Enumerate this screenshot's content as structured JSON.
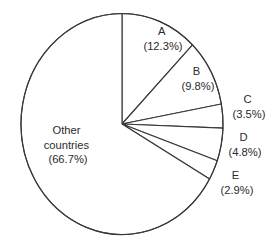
{
  "chart_data": {
    "type": "pie",
    "title": "",
    "subtitle": "",
    "xlabel": "",
    "ylabel": "",
    "legend_position": "none",
    "grid": false,
    "start_angle_deg": 0,
    "direction": "clockwise",
    "categories": [
      "A",
      "B",
      "C",
      "D",
      "E",
      "Other countries"
    ],
    "values": [
      12.3,
      9.8,
      3.5,
      4.8,
      2.9,
      66.7
    ],
    "units": "%",
    "slices": [
      {
        "name": "A",
        "label": "A",
        "value": 12.3,
        "percent_text": "(12.3%)",
        "label_position": "inside",
        "fill": "#ffffff",
        "stroke": "#3a3a3a"
      },
      {
        "name": "B",
        "label": "B",
        "value": 9.8,
        "percent_text": "(9.8%)",
        "label_position": "inside",
        "fill": "#ffffff",
        "stroke": "#3a3a3a"
      },
      {
        "name": "C",
        "label": "C",
        "value": 3.5,
        "percent_text": "(3.5%)",
        "label_position": "outside",
        "fill": "#ffffff",
        "stroke": "#3a3a3a"
      },
      {
        "name": "D",
        "label": "D",
        "value": 4.8,
        "percent_text": "(4.8%)",
        "label_position": "outside",
        "fill": "#ffffff",
        "stroke": "#3a3a3a"
      },
      {
        "name": "E",
        "label": "E",
        "value": 2.9,
        "percent_text": "(2.9%)",
        "label_position": "outside",
        "fill": "#ffffff",
        "stroke": "#3a3a3a"
      },
      {
        "name": "Other countries",
        "label_line1": "Other",
        "label_line2": "countries",
        "value": 66.7,
        "percent_text": "(66.7%)",
        "label_position": "inside",
        "fill": "#ffffff",
        "stroke": "#3a3a3a"
      }
    ]
  },
  "figure": {
    "background": "#ffffff",
    "stroke_color": "#3a3a3a",
    "text_color": "#2b2b2b"
  }
}
